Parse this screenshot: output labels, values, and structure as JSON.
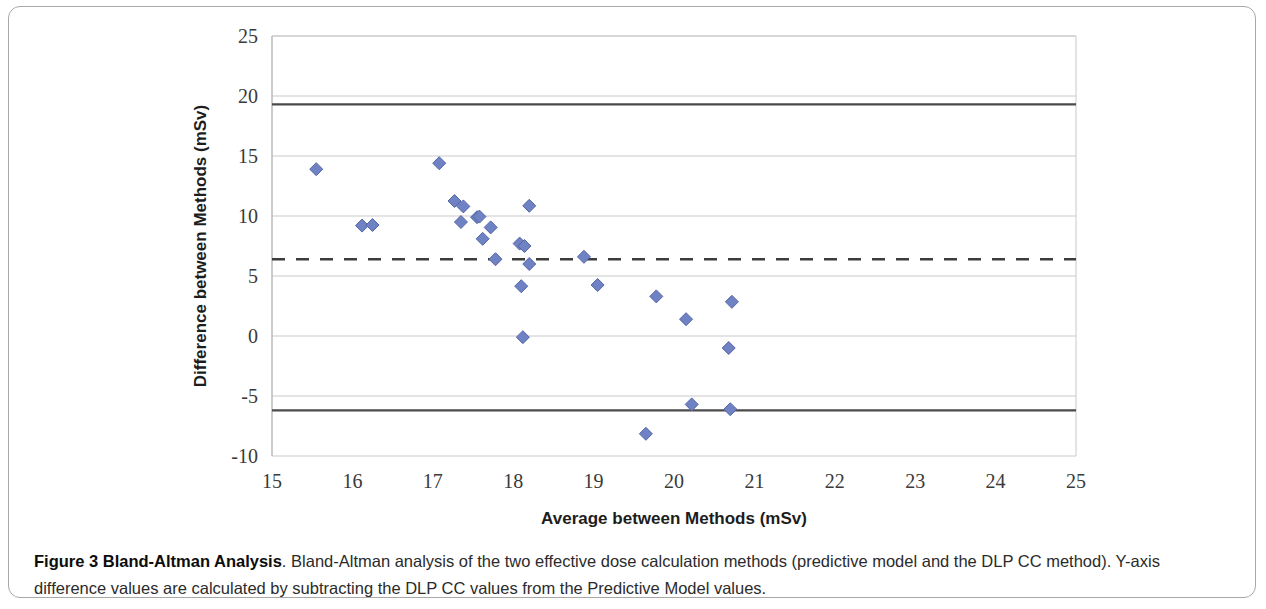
{
  "figure": {
    "caption_lead": "Figure 3 Bland-Altman Analysis",
    "caption_body": ". Bland-Altman analysis of the two effective dose calculation methods (predictive model and the DLP CC method). Y-axis difference values are calculated by subtracting the DLP CC values from the Predictive Model values."
  },
  "chart_data": {
    "type": "scatter",
    "title": "",
    "xlabel": "Average between Methods (mSv)",
    "ylabel": "Difference between Methods (mSv)",
    "xlim": [
      15,
      25
    ],
    "ylim": [
      -10,
      25
    ],
    "xticks": [
      15,
      16,
      17,
      18,
      19,
      20,
      21,
      22,
      23,
      24,
      25
    ],
    "yticks": [
      -10,
      -5,
      0,
      5,
      10,
      15,
      20,
      25
    ],
    "xtick_labels": [
      "15",
      "16",
      "17",
      "18",
      "19",
      "20",
      "21",
      "22",
      "23",
      "24",
      "25"
    ],
    "ytick_labels": [
      "-10",
      "-5",
      "0",
      "5",
      "10",
      "15",
      "20",
      "25"
    ],
    "grid": "horizontal",
    "legend": "none",
    "marker": {
      "shape": "diamond",
      "color": "#6f83c4",
      "edge_color": "#5566a8",
      "size": 13
    },
    "series": [
      {
        "name": "Method difference",
        "points": [
          [
            15.55,
            13.9
          ],
          [
            16.12,
            9.2
          ],
          [
            16.25,
            9.25
          ],
          [
            17.08,
            14.4
          ],
          [
            17.27,
            11.25
          ],
          [
            17.38,
            10.8
          ],
          [
            17.35,
            9.5
          ],
          [
            17.55,
            9.9
          ],
          [
            17.58,
            9.95
          ],
          [
            17.62,
            8.1
          ],
          [
            17.72,
            9.05
          ],
          [
            17.78,
            6.4
          ],
          [
            18.08,
            7.7
          ],
          [
            18.14,
            7.5
          ],
          [
            18.2,
            10.85
          ],
          [
            18.2,
            6.0
          ],
          [
            18.1,
            4.15
          ],
          [
            18.12,
            -0.1
          ],
          [
            18.88,
            6.6
          ],
          [
            19.05,
            4.25
          ],
          [
            19.65,
            -8.15
          ],
          [
            19.78,
            3.3
          ],
          [
            20.15,
            1.4
          ],
          [
            20.22,
            -5.7
          ],
          [
            20.68,
            -1.0
          ],
          [
            20.7,
            -6.1
          ],
          [
            20.72,
            2.85
          ]
        ]
      }
    ],
    "reference_lines": [
      {
        "name": "upper-limit-of-agreement",
        "value": 19.3,
        "style": "solid",
        "color": "#4a4a4a"
      },
      {
        "name": "mean-bias",
        "value": 6.4,
        "style": "dashed",
        "color": "#3c3c3c"
      },
      {
        "name": "lower-limit-of-agreement",
        "value": -6.2,
        "style": "solid",
        "color": "#4a4a4a"
      }
    ]
  }
}
